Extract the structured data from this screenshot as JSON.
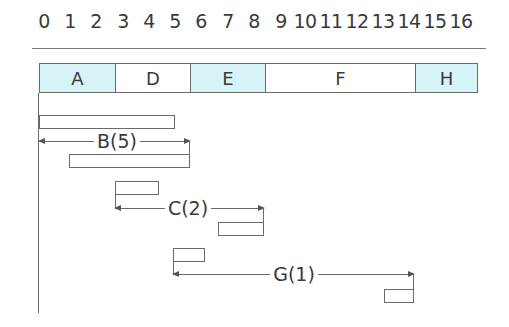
{
  "axis": {
    "ticks": [
      "0",
      "1",
      "2",
      "3",
      "4",
      "5",
      "6",
      "7",
      "8",
      "9",
      "10",
      "11",
      "12",
      "13",
      "14",
      "15",
      "16"
    ],
    "tick_x": [
      44,
      70,
      96,
      123,
      149,
      175,
      201,
      228,
      254,
      281,
      305,
      331,
      357,
      383,
      409,
      435,
      461
    ]
  },
  "top_bar": {
    "segments": [
      {
        "label": "A",
        "x": 39,
        "w": 76,
        "fill": "#d6f3f8"
      },
      {
        "label": "D",
        "x": 115,
        "w": 75,
        "fill": "#ffffff"
      },
      {
        "label": "E",
        "x": 190,
        "w": 75,
        "fill": "#d6f3f8"
      },
      {
        "label": "F",
        "x": 265,
        "w": 150,
        "fill": "#ffffff"
      },
      {
        "label": "H",
        "x": 415,
        "w": 63,
        "fill": "#d6f3f8"
      }
    ]
  },
  "float_links": [
    {
      "label": "B(5)",
      "bar1": {
        "x": 39,
        "y": 115,
        "w": 136
      },
      "arrow": {
        "x1": 39,
        "x2": 190,
        "y": 141
      },
      "bar2": {
        "x": 69,
        "y": 154,
        "w": 121
      },
      "label_x": 117
    },
    {
      "label": "C(2)",
      "bar1": {
        "x": 115,
        "y": 181,
        "w": 44
      },
      "arrow": {
        "x1": 115,
        "x2": 264,
        "y": 208
      },
      "bar2": {
        "x": 218,
        "y": 222,
        "w": 46
      },
      "label_x": 188
    },
    {
      "label": "G(1)",
      "bar1": {
        "x": 173,
        "y": 248,
        "w": 32
      },
      "arrow": {
        "x1": 173,
        "x2": 414,
        "y": 274
      },
      "bar2": {
        "x": 384,
        "y": 289,
        "w": 30
      },
      "label_x": 294
    }
  ],
  "colors": {
    "critical_fill": "#d6f3f8",
    "line": "#6a6a6a",
    "text": "#3a3a3a"
  }
}
